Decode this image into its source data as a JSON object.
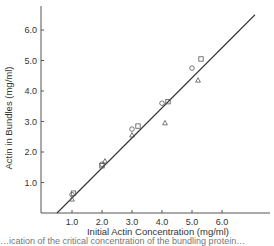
{
  "chart_data": {
    "type": "scatter",
    "title": "",
    "xlabel": "Initial Actin Concentration (mg/ml)",
    "ylabel": "Actin in Bundles (mg/ml)",
    "xlim": [
      0,
      7.6
    ],
    "ylim": [
      0,
      6.6
    ],
    "x_ticks": [
      "1.0",
      "2.0",
      "3.0",
      "4.0",
      "5.0",
      "6.0"
    ],
    "y_ticks": [
      "1.0",
      "2.0",
      "3.0",
      "4.0",
      "5.0",
      "6.0"
    ],
    "grid": false,
    "legend": null,
    "series": [
      {
        "name": "circles",
        "marker": "circle",
        "points": [
          [
            1.0,
            0.6
          ],
          [
            2.0,
            1.6
          ],
          [
            3.0,
            2.75
          ],
          [
            4.0,
            3.6
          ],
          [
            5.0,
            4.75
          ]
        ]
      },
      {
        "name": "squares",
        "marker": "square",
        "points": [
          [
            1.05,
            0.65
          ],
          [
            2.0,
            1.55
          ],
          [
            3.2,
            2.85
          ],
          [
            4.2,
            3.65
          ],
          [
            5.3,
            5.05
          ]
        ]
      },
      {
        "name": "triangles",
        "marker": "triangle",
        "points": [
          [
            1.0,
            0.45
          ],
          [
            2.1,
            1.7
          ],
          [
            3.0,
            2.55
          ],
          [
            4.1,
            2.95
          ],
          [
            5.2,
            4.35
          ]
        ]
      }
    ],
    "fit_line": {
      "type": "linear",
      "x_intercept": 0.5,
      "points": [
        [
          0.5,
          0.0
        ],
        [
          7.1,
          6.5
        ]
      ]
    }
  },
  "caption": {
    "partial_text": "…ication of the critical concentration of the bundling protein…"
  }
}
